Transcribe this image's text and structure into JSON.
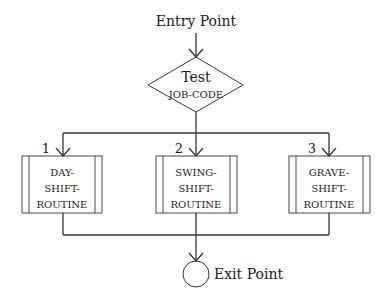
{
  "diagram": {
    "type": "flowchart",
    "entry": {
      "label": "Entry Point"
    },
    "decision": {
      "title": "Test",
      "subject": "JOB-CODE"
    },
    "branches": [
      {
        "number": "1",
        "lines": [
          "DAY-",
          "SHIFT-",
          "ROUTINE"
        ]
      },
      {
        "number": "2",
        "lines": [
          "SWING-",
          "SHIFT-",
          "ROUTINE"
        ]
      },
      {
        "number": "3",
        "lines": [
          "GRAVE-",
          "SHIFT-",
          "ROUTINE"
        ]
      }
    ],
    "exit": {
      "label": "Exit Point"
    },
    "colors": {
      "line": "#333333",
      "text": "#1a1a1a",
      "background": "#ffffff"
    }
  }
}
